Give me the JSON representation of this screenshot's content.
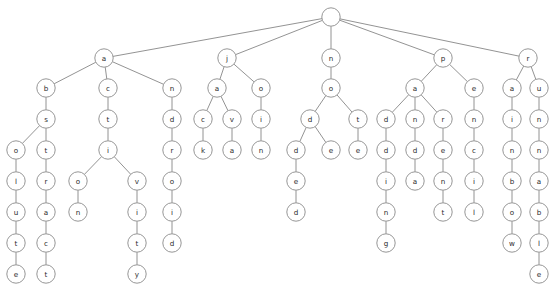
{
  "diagram": {
    "type": "trie",
    "node_radius": 9.2,
    "leaf_radius": 8.6,
    "colors": {
      "background": "#ffffff",
      "node_fill": "#ffffff",
      "node_stroke": "#8a8a8a",
      "edge_stroke": "#777777",
      "label_text": "#2b2b2b"
    },
    "words": [
      "absolute",
      "abstract",
      "action",
      "activity",
      "android",
      "jack",
      "java",
      "join",
      "nodded",
      "node",
      "note",
      "padding",
      "panda",
      "parent",
      "pencil",
      "rainbow",
      "runnable"
    ],
    "levels_y": [
      17,
      58,
      88,
      119,
      150,
      181,
      212,
      243,
      274
    ],
    "nodes": [
      {
        "id": "root",
        "label": "",
        "x": 331,
        "y": 17,
        "level": 0,
        "parent": null
      },
      {
        "id": "a",
        "label": "a",
        "x": 104,
        "y": 58,
        "level": 1,
        "parent": "root"
      },
      {
        "id": "j",
        "label": "j",
        "x": 227,
        "y": 58,
        "level": 1,
        "parent": "root"
      },
      {
        "id": "n",
        "label": "n",
        "x": 331,
        "y": 58,
        "level": 1,
        "parent": "root"
      },
      {
        "id": "p",
        "label": "p",
        "x": 443,
        "y": 58,
        "level": 1,
        "parent": "root"
      },
      {
        "id": "r",
        "label": "r",
        "x": 528,
        "y": 58,
        "level": 1,
        "parent": "root"
      },
      {
        "id": "ab",
        "label": "b",
        "x": 46,
        "y": 88,
        "level": 2,
        "parent": "a"
      },
      {
        "id": "ac",
        "label": "c",
        "x": 108,
        "y": 88,
        "level": 2,
        "parent": "a"
      },
      {
        "id": "an",
        "label": "n",
        "x": 172,
        "y": 88,
        "level": 2,
        "parent": "a"
      },
      {
        "id": "ja",
        "label": "a",
        "x": 217,
        "y": 88,
        "level": 2,
        "parent": "j"
      },
      {
        "id": "jo",
        "label": "o",
        "x": 261,
        "y": 88,
        "level": 2,
        "parent": "j"
      },
      {
        "id": "no",
        "label": "o",
        "x": 331,
        "y": 88,
        "level": 2,
        "parent": "n"
      },
      {
        "id": "pa",
        "label": "a",
        "x": 415,
        "y": 88,
        "level": 2,
        "parent": "p"
      },
      {
        "id": "pe",
        "label": "e",
        "x": 474,
        "y": 88,
        "level": 2,
        "parent": "p"
      },
      {
        "id": "ra",
        "label": "a",
        "x": 512,
        "y": 88,
        "level": 2,
        "parent": "r"
      },
      {
        "id": "ru",
        "label": "u",
        "x": 539,
        "y": 88,
        "level": 2,
        "parent": "r"
      },
      {
        "id": "abs",
        "label": "s",
        "x": 46,
        "y": 119,
        "level": 3,
        "parent": "ab"
      },
      {
        "id": "act",
        "label": "t",
        "x": 108,
        "y": 119,
        "level": 3,
        "parent": "ac"
      },
      {
        "id": "and",
        "label": "d",
        "x": 172,
        "y": 119,
        "level": 3,
        "parent": "an"
      },
      {
        "id": "jac",
        "label": "c",
        "x": 203,
        "y": 119,
        "level": 3,
        "parent": "ja"
      },
      {
        "id": "jav",
        "label": "v",
        "x": 232,
        "y": 119,
        "level": 3,
        "parent": "ja"
      },
      {
        "id": "joi",
        "label": "i",
        "x": 261,
        "y": 119,
        "level": 3,
        "parent": "jo"
      },
      {
        "id": "nod",
        "label": "d",
        "x": 310,
        "y": 119,
        "level": 3,
        "parent": "no"
      },
      {
        "id": "not",
        "label": "t",
        "x": 358,
        "y": 119,
        "level": 3,
        "parent": "no"
      },
      {
        "id": "pad",
        "label": "d",
        "x": 386,
        "y": 119,
        "level": 3,
        "parent": "pa"
      },
      {
        "id": "pan",
        "label": "n",
        "x": 415,
        "y": 119,
        "level": 3,
        "parent": "pa"
      },
      {
        "id": "par",
        "label": "r",
        "x": 443,
        "y": 119,
        "level": 3,
        "parent": "pa"
      },
      {
        "id": "pen",
        "label": "n",
        "x": 474,
        "y": 119,
        "level": 3,
        "parent": "pe"
      },
      {
        "id": "rai",
        "label": "i",
        "x": 512,
        "y": 119,
        "level": 3,
        "parent": "ra"
      },
      {
        "id": "run",
        "label": "n",
        "x": 539,
        "y": 119,
        "level": 3,
        "parent": "ru"
      },
      {
        "id": "abso",
        "label": "o",
        "x": 16,
        "y": 150,
        "level": 4,
        "parent": "abs"
      },
      {
        "id": "abst",
        "label": "t",
        "x": 46,
        "y": 150,
        "level": 4,
        "parent": "abs"
      },
      {
        "id": "acti",
        "label": "i",
        "x": 108,
        "y": 150,
        "level": 4,
        "parent": "act"
      },
      {
        "id": "andr",
        "label": "r",
        "x": 172,
        "y": 150,
        "level": 4,
        "parent": "and"
      },
      {
        "id": "jack",
        "label": "k",
        "x": 203,
        "y": 150,
        "level": 4,
        "parent": "jac"
      },
      {
        "id": "java",
        "label": "a",
        "x": 232,
        "y": 150,
        "level": 4,
        "parent": "jav"
      },
      {
        "id": "join",
        "label": "n",
        "x": 261,
        "y": 150,
        "level": 4,
        "parent": "joi"
      },
      {
        "id": "nodd",
        "label": "d",
        "x": 296,
        "y": 150,
        "level": 4,
        "parent": "nod"
      },
      {
        "id": "node",
        "label": "e",
        "x": 331,
        "y": 150,
        "level": 4,
        "parent": "nod"
      },
      {
        "id": "note",
        "label": "e",
        "x": 358,
        "y": 150,
        "level": 4,
        "parent": "not"
      },
      {
        "id": "padd",
        "label": "d",
        "x": 386,
        "y": 150,
        "level": 4,
        "parent": "pad"
      },
      {
        "id": "pand",
        "label": "d",
        "x": 415,
        "y": 150,
        "level": 4,
        "parent": "pan"
      },
      {
        "id": "pare",
        "label": "e",
        "x": 443,
        "y": 150,
        "level": 4,
        "parent": "par"
      },
      {
        "id": "penc",
        "label": "c",
        "x": 474,
        "y": 150,
        "level": 4,
        "parent": "pen"
      },
      {
        "id": "rain",
        "label": "n",
        "x": 512,
        "y": 150,
        "level": 4,
        "parent": "rai"
      },
      {
        "id": "runn",
        "label": "n",
        "x": 539,
        "y": 150,
        "level": 4,
        "parent": "run"
      },
      {
        "id": "absol",
        "label": "l",
        "x": 16,
        "y": 181,
        "level": 5,
        "parent": "abso"
      },
      {
        "id": "abstr",
        "label": "r",
        "x": 46,
        "y": 181,
        "level": 5,
        "parent": "abst"
      },
      {
        "id": "actio",
        "label": "o",
        "x": 78,
        "y": 181,
        "level": 5,
        "parent": "acti"
      },
      {
        "id": "activ",
        "label": "v",
        "x": 137,
        "y": 181,
        "level": 5,
        "parent": "acti"
      },
      {
        "id": "andro",
        "label": "o",
        "x": 172,
        "y": 181,
        "level": 5,
        "parent": "andr"
      },
      {
        "id": "nodde",
        "label": "e",
        "x": 296,
        "y": 181,
        "level": 5,
        "parent": "nodd"
      },
      {
        "id": "paddi",
        "label": "i",
        "x": 386,
        "y": 181,
        "level": 5,
        "parent": "padd"
      },
      {
        "id": "panda",
        "label": "a",
        "x": 415,
        "y": 181,
        "level": 5,
        "parent": "pand"
      },
      {
        "id": "paren",
        "label": "n",
        "x": 443,
        "y": 181,
        "level": 5,
        "parent": "pare"
      },
      {
        "id": "penci",
        "label": "i",
        "x": 474,
        "y": 181,
        "level": 5,
        "parent": "penc"
      },
      {
        "id": "rainb",
        "label": "b",
        "x": 512,
        "y": 181,
        "level": 5,
        "parent": "rain"
      },
      {
        "id": "runna",
        "label": "a",
        "x": 539,
        "y": 181,
        "level": 5,
        "parent": "runn"
      },
      {
        "id": "absolu",
        "label": "u",
        "x": 16,
        "y": 212,
        "level": 6,
        "parent": "absol"
      },
      {
        "id": "abstra",
        "label": "a",
        "x": 46,
        "y": 212,
        "level": 6,
        "parent": "abstr"
      },
      {
        "id": "action",
        "label": "n",
        "x": 78,
        "y": 212,
        "level": 6,
        "parent": "actio"
      },
      {
        "id": "activi",
        "label": "i",
        "x": 137,
        "y": 212,
        "level": 6,
        "parent": "activ"
      },
      {
        "id": "androi",
        "label": "i",
        "x": 172,
        "y": 212,
        "level": 6,
        "parent": "andro"
      },
      {
        "id": "nodded",
        "label": "d",
        "x": 296,
        "y": 212,
        "level": 6,
        "parent": "nodde"
      },
      {
        "id": "paddin",
        "label": "n",
        "x": 386,
        "y": 212,
        "level": 6,
        "parent": "paddi"
      },
      {
        "id": "parent",
        "label": "t",
        "x": 443,
        "y": 212,
        "level": 6,
        "parent": "paren"
      },
      {
        "id": "pencil",
        "label": "l",
        "x": 474,
        "y": 212,
        "level": 6,
        "parent": "penci"
      },
      {
        "id": "rainbo",
        "label": "o",
        "x": 512,
        "y": 212,
        "level": 6,
        "parent": "rainb"
      },
      {
        "id": "runnab",
        "label": "b",
        "x": 539,
        "y": 212,
        "level": 6,
        "parent": "runna"
      },
      {
        "id": "absolut",
        "label": "t",
        "x": 16,
        "y": 243,
        "level": 7,
        "parent": "absolu"
      },
      {
        "id": "abstrac",
        "label": "c",
        "x": 46,
        "y": 243,
        "level": 7,
        "parent": "abstra"
      },
      {
        "id": "activit",
        "label": "t",
        "x": 137,
        "y": 243,
        "level": 7,
        "parent": "activi"
      },
      {
        "id": "android",
        "label": "d",
        "x": 172,
        "y": 243,
        "level": 7,
        "parent": "androi"
      },
      {
        "id": "padding",
        "label": "g",
        "x": 386,
        "y": 243,
        "level": 7,
        "parent": "paddin"
      },
      {
        "id": "rainbow",
        "label": "w",
        "x": 512,
        "y": 243,
        "level": 7,
        "parent": "rainbo"
      },
      {
        "id": "runnabl",
        "label": "l",
        "x": 539,
        "y": 243,
        "level": 7,
        "parent": "runnab"
      },
      {
        "id": "absolute",
        "label": "e",
        "x": 16,
        "y": 274,
        "level": 8,
        "parent": "absolut"
      },
      {
        "id": "abstract",
        "label": "t",
        "x": 46,
        "y": 274,
        "level": 8,
        "parent": "abstrac"
      },
      {
        "id": "activity",
        "label": "y",
        "x": 137,
        "y": 274,
        "level": 8,
        "parent": "activit"
      },
      {
        "id": "runnable",
        "label": "e",
        "x": 539,
        "y": 274,
        "level": 8,
        "parent": "runnabl"
      }
    ]
  }
}
